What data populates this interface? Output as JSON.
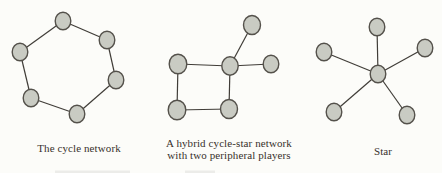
{
  "figure": {
    "background": "#fcfcf9",
    "caption_color": "#38312c"
  },
  "style": {
    "node_fill": "#c9cbc3",
    "node_stroke": "#54514b",
    "node_rx": 7.8,
    "node_ry": 8.8,
    "node_stroke_width": 1.4,
    "edge_stroke": "#403d38",
    "edge_width": 1.2
  },
  "diagrams": [
    {
      "name": "cycle-network",
      "caption_lines": [
        "The cycle network"
      ],
      "caption": {
        "x": 79,
        "y": 142
      },
      "nodes": [
        {
          "x": 63,
          "y": 21
        },
        {
          "x": 107,
          "y": 40
        },
        {
          "x": 116,
          "y": 80
        },
        {
          "x": 77,
          "y": 114
        },
        {
          "x": 31,
          "y": 98
        },
        {
          "x": 20,
          "y": 52
        }
      ],
      "edges": [
        [
          0,
          1
        ],
        [
          1,
          2
        ],
        [
          2,
          3
        ],
        [
          3,
          4
        ],
        [
          4,
          5
        ],
        [
          5,
          0
        ]
      ]
    },
    {
      "name": "hybrid-cycle-star-network",
      "caption_lines": [
        "A hybrid cycle-star network",
        "with two peripheral players"
      ],
      "caption": {
        "x": 229,
        "y": 137
      },
      "nodes": [
        {
          "x": 178,
          "y": 64,
          "rx": 8.8,
          "ry": 9.8
        },
        {
          "x": 230,
          "y": 66,
          "rx": 8.2,
          "ry": 9.2
        },
        {
          "x": 177,
          "y": 110,
          "rx": 8.8,
          "ry": 9.8
        },
        {
          "x": 229,
          "y": 109,
          "rx": 8.5,
          "ry": 9.5
        },
        {
          "x": 252,
          "y": 25,
          "rx": 8.5,
          "ry": 9.5
        },
        {
          "x": 271,
          "y": 64
        }
      ],
      "edges": [
        [
          0,
          1
        ],
        [
          0,
          2
        ],
        [
          2,
          3
        ],
        [
          3,
          1
        ],
        [
          1,
          4
        ],
        [
          1,
          5
        ]
      ]
    },
    {
      "name": "star-network",
      "caption_lines": [
        "Star"
      ],
      "caption": {
        "x": 383,
        "y": 145
      },
      "nodes": [
        {
          "x": 378,
          "y": 74
        },
        {
          "x": 377,
          "y": 27
        },
        {
          "x": 324,
          "y": 52
        },
        {
          "x": 425,
          "y": 48
        },
        {
          "x": 334,
          "y": 112
        },
        {
          "x": 407,
          "y": 115
        }
      ],
      "edges": [
        [
          0,
          1
        ],
        [
          0,
          2
        ],
        [
          0,
          3
        ],
        [
          0,
          4
        ],
        [
          0,
          5
        ]
      ]
    }
  ],
  "artifacts": [
    {
      "x": 55,
      "y": 170.5,
      "w": 75,
      "h": 2.5
    },
    {
      "x": 185,
      "y": 170.5,
      "w": 30,
      "h": 2.5
    }
  ]
}
